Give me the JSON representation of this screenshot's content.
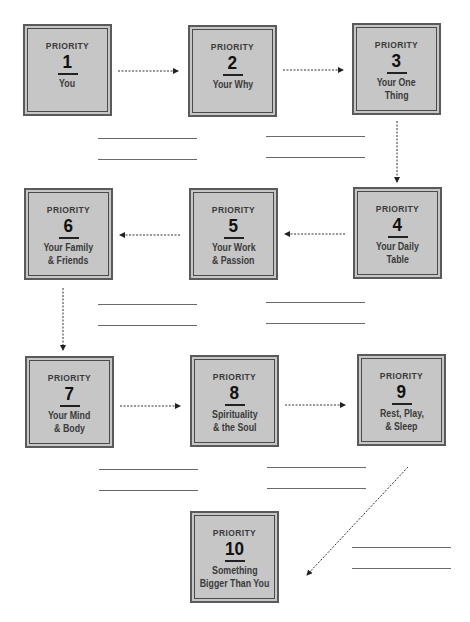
{
  "diagram": {
    "type": "flowchart",
    "box_label": "PRIORITY",
    "colors": {
      "box_fill": "#c6c6c6",
      "box_border": "#5a5a5a",
      "text": "#3a3a3a",
      "arrow": "#222222",
      "line": "#6a6a6a"
    },
    "priorities": [
      {
        "number": "1",
        "title": "You"
      },
      {
        "number": "2",
        "title": "Your Why"
      },
      {
        "number": "3",
        "title": "Your One Thing"
      },
      {
        "number": "4",
        "title": "Your Daily Table"
      },
      {
        "number": "5",
        "title": "Your Work & Passion"
      },
      {
        "number": "6",
        "title": "Your Family & Friends"
      },
      {
        "number": "7",
        "title": "Your Mind & Body"
      },
      {
        "number": "8",
        "title": "Spirituality & the Soul"
      },
      {
        "number": "9",
        "title": "Rest, Play, & Sleep"
      },
      {
        "number": "10",
        "title": "Something Bigger Than You"
      }
    ],
    "title_lines": {
      "p1": [
        "You"
      ],
      "p2": [
        "Your Why"
      ],
      "p3": [
        "Your One",
        "Thing"
      ],
      "p4": [
        "Your Daily",
        "Table"
      ],
      "p5": [
        "Your Work",
        "& Passion"
      ],
      "p6": [
        "Your Family",
        "& Friends"
      ],
      "p7": [
        "Your Mind",
        "& Body"
      ],
      "p8": [
        "Spirituality",
        "& the Soul"
      ],
      "p9": [
        "Rest, Play,",
        "& Sleep"
      ],
      "p10": [
        "Something",
        "Bigger Than You"
      ]
    },
    "edges": [
      [
        "1",
        "2"
      ],
      [
        "2",
        "3"
      ],
      [
        "3",
        "4"
      ],
      [
        "4",
        "5"
      ],
      [
        "5",
        "6"
      ],
      [
        "6",
        "7"
      ],
      [
        "7",
        "8"
      ],
      [
        "8",
        "9"
      ],
      [
        "9",
        "10"
      ]
    ],
    "blank_write_in_lines_count": 14
  }
}
